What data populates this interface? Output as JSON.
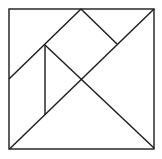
{
  "diagram": {
    "type": "tangram-square",
    "background": "#ffffff",
    "stroke": "#1a1a1a",
    "stroke_width": 1.4,
    "outline": {
      "x1": 9,
      "y1": 9,
      "x2": 154,
      "y2": 149
    },
    "lines": [
      {
        "name": "main-diagonal",
        "x1": 9.5,
        "y1": 149,
        "x2": 154,
        "y2": 9
      },
      {
        "name": "upper-left-diagonal",
        "x1": 81,
        "y1": 9,
        "x2": 9,
        "y2": 79
      },
      {
        "name": "upper-right-segment",
        "x1": 81,
        "y1": 9,
        "x2": 117,
        "y2": 44
      },
      {
        "name": "cross-diagonal",
        "x1": 45,
        "y1": 45,
        "x2": 154,
        "y2": 148
      },
      {
        "name": "vertical-segment",
        "x1": 45,
        "y1": 45,
        "x2": 45,
        "y2": 115
      }
    ]
  }
}
